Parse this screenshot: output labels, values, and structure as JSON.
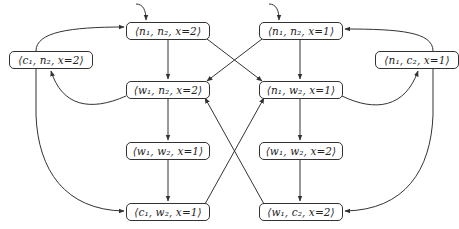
{
  "diagram": {
    "type": "state-transition-graph",
    "nodes": [
      {
        "id": "n1n2x2",
        "label": "⟨n₁, n₂, x=2⟩",
        "initial": true,
        "box": [
          126,
          22,
          84,
          18
        ]
      },
      {
        "id": "n1n2x1",
        "label": "⟨n₁, n₂, x=1⟩",
        "initial": true,
        "box": [
          259,
          22,
          84,
          18
        ]
      },
      {
        "id": "c1n2x2",
        "label": "⟨c₁, n₂, x=2⟩",
        "initial": false,
        "box": [
          9,
          51,
          84,
          18
        ]
      },
      {
        "id": "n1c2x1",
        "label": "⟨n₁, c₂, x=1⟩",
        "initial": false,
        "box": [
          375,
          51,
          84,
          18
        ]
      },
      {
        "id": "w1n2x2",
        "label": "⟨w₁, n₂, x=2⟩",
        "initial": false,
        "box": [
          126,
          81,
          84,
          18
        ]
      },
      {
        "id": "n1w2x1",
        "label": "⟨n₁, w₂, x=1⟩",
        "initial": false,
        "box": [
          259,
          81,
          84,
          18
        ]
      },
      {
        "id": "w1w2x1",
        "label": "⟨w₁, w₂, x=1⟩",
        "initial": false,
        "box": [
          126,
          142,
          84,
          18
        ]
      },
      {
        "id": "w1w2x2",
        "label": "⟨w₁, w₂, x=2⟩",
        "initial": false,
        "box": [
          259,
          142,
          84,
          18
        ]
      },
      {
        "id": "c1w2x1",
        "label": "⟨c₁, w₂, x=1⟩",
        "initial": false,
        "box": [
          126,
          203,
          84,
          18
        ]
      },
      {
        "id": "w1c2x2",
        "label": "⟨w₁, c₂, x=2⟩",
        "initial": false,
        "box": [
          259,
          203,
          84,
          18
        ]
      }
    ],
    "edges": [
      {
        "from": "n1n2x2",
        "to": "w1n2x2"
      },
      {
        "from": "n1n2x2",
        "to": "n1w2x1"
      },
      {
        "from": "n1n2x1",
        "to": "n1w2x1"
      },
      {
        "from": "n1n2x1",
        "to": "w1n2x2"
      },
      {
        "from": "c1n2x2",
        "to": "n1n2x2"
      },
      {
        "from": "c1n2x2",
        "to": "c1w2x1"
      },
      {
        "from": "w1n2x2",
        "to": "c1n2x2"
      },
      {
        "from": "w1n2x2",
        "to": "w1w2x1"
      },
      {
        "from": "n1w2x1",
        "to": "n1c2x1"
      },
      {
        "from": "n1w2x1",
        "to": "w1w2x2"
      },
      {
        "from": "n1c2x1",
        "to": "n1n2x1"
      },
      {
        "from": "n1c2x1",
        "to": "w1c2x2"
      },
      {
        "from": "w1w2x1",
        "to": "c1w2x1"
      },
      {
        "from": "w1w2x2",
        "to": "w1c2x2"
      },
      {
        "from": "c1w2x1",
        "to": "n1w2x1"
      },
      {
        "from": "w1c2x2",
        "to": "w1n2x2"
      }
    ]
  },
  "labels": {
    "n1n2x2": "⟨n₁, n₂, x=2⟩",
    "n1n2x1": "⟨n₁, n₂, x=1⟩",
    "c1n2x2": "⟨c₁, n₂, x=2⟩",
    "n1c2x1": "⟨n₁, c₂, x=1⟩",
    "w1n2x2": "⟨w₁, n₂, x=2⟩",
    "n1w2x1": "⟨n₁, w₂, x=1⟩",
    "w1w2x1": "⟨w₁, w₂, x=1⟩",
    "w1w2x2": "⟨w₁, w₂, x=2⟩",
    "c1w2x1": "⟨c₁, w₂, x=1⟩",
    "w1c2x2": "⟨w₁, c₂, x=2⟩"
  },
  "colors": {
    "stroke": "#333333",
    "background": "#ffffff",
    "text": "#222222"
  }
}
